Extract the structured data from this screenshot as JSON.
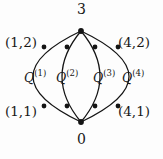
{
  "figure": {
    "type": "graph-diagram",
    "background_color": "#fdfdfd",
    "stroke_color": "#141414",
    "node_color": "#141414"
  },
  "vertices": {
    "top_label": "3",
    "bottom_label": "0"
  },
  "corner_labels": {
    "top_left": "(1,2)",
    "top_right": "(4,2)",
    "bottom_left": "(1,1)",
    "bottom_right": "(4,1)"
  },
  "arc_labels": [
    {
      "base": "Q",
      "superscript": "(1)"
    },
    {
      "base": "Q",
      "superscript": "(2)"
    },
    {
      "base": "Q",
      "superscript": "(3)"
    },
    {
      "base": "Q",
      "superscript": "(4)"
    }
  ],
  "geometry": {
    "top_vertex": {
      "x": 81,
      "y": 31
    },
    "bottom_vertex": {
      "x": 81,
      "y": 122
    },
    "arcs": [
      {
        "name": "arc-1",
        "bulge_x": 33,
        "upper_node": {
          "x": 44,
          "y": 47
        },
        "lower_node": {
          "x": 44,
          "y": 106
        }
      },
      {
        "name": "arc-2",
        "bulge_x": 62,
        "upper_node": {
          "x": 67,
          "y": 47
        },
        "lower_node": {
          "x": 67,
          "y": 106
        }
      },
      {
        "name": "arc-3",
        "bulge_x": 100,
        "upper_node": {
          "x": 95,
          "y": 47
        },
        "lower_node": {
          "x": 95,
          "y": 106
        }
      },
      {
        "name": "arc-4",
        "bulge_x": 129,
        "upper_node": {
          "x": 118,
          "y": 47
        },
        "lower_node": {
          "x": 118,
          "y": 106
        }
      }
    ],
    "node_radius": 2.4,
    "stroke_width": 1.25
  }
}
